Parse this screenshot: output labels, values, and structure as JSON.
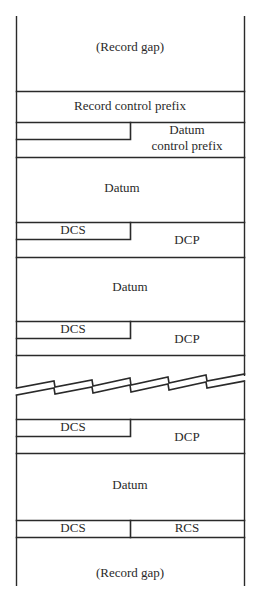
{
  "diagram": {
    "type": "record-structure",
    "colors": {
      "line": "#2a2a2a",
      "background": "#ffffff",
      "text": "#2a2a2a"
    },
    "blocks": {
      "record_gap_top": {
        "label": "(Record gap)"
      },
      "record_control_prefix": {
        "label": "Record control prefix"
      },
      "datum_control_prefix": {
        "label_line1": "Datum",
        "label_line2": "control prefix"
      },
      "datum_1": {
        "label": "Datum"
      },
      "dcs_1": {
        "label": "DCS"
      },
      "dcp_1": {
        "label": "DCP"
      },
      "datum_2": {
        "label": "Datum"
      },
      "dcs_2": {
        "label": "DCS"
      },
      "dcp_2": {
        "label": "DCP"
      },
      "break": {
        "label": ""
      },
      "dcs_3": {
        "label": "DCS"
      },
      "dcp_3": {
        "label": "DCP"
      },
      "datum_3": {
        "label": "Datum"
      },
      "dcs_final": {
        "label": "DCS"
      },
      "rcs": {
        "label": "RCS"
      },
      "record_gap_bottom": {
        "label": "(Record gap)"
      }
    },
    "sequence": [
      "(Record gap)",
      "Record control prefix",
      "Datum control prefix",
      "Datum",
      "DCS | DCP",
      "Datum",
      "DCS | DCP",
      "~ break ~",
      "DCS | DCP",
      "Datum",
      "DCS | RCS",
      "(Record gap)"
    ]
  }
}
